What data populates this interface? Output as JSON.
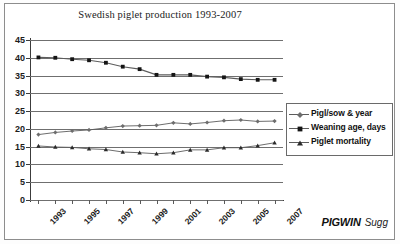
{
  "chart_data": {
    "type": "line",
    "title": "Swedish piglet production 1993-2007",
    "xlabel": "",
    "ylabel": "",
    "ylim": [
      0,
      45
    ],
    "ytick_step": 5,
    "yticks": [
      45,
      40,
      35,
      30,
      25,
      20,
      15,
      10,
      5,
      0
    ],
    "grid": true,
    "legend_position": "right",
    "x": [
      1993,
      1994,
      1995,
      1996,
      1997,
      1998,
      1999,
      2000,
      2001,
      2002,
      2003,
      2004,
      2005,
      2006,
      2007
    ],
    "xtick_labels": [
      "1993",
      "1995",
      "1997",
      "1999",
      "2001",
      "2003",
      "2005",
      "2007"
    ],
    "xtick_values": [
      1993,
      1995,
      1997,
      1999,
      2001,
      2003,
      2005,
      2007
    ],
    "series": [
      {
        "name": "Pigl/sow & year",
        "marker": "diamond",
        "values": [
          18.4,
          19.0,
          19.4,
          19.7,
          20.3,
          20.8,
          20.9,
          21.0,
          21.7,
          21.4,
          21.8,
          22.3,
          22.5,
          22.1,
          22.2
        ]
      },
      {
        "name": "Weaning age, days",
        "marker": "square",
        "values": [
          40.1,
          40.0,
          39.6,
          39.3,
          38.6,
          37.5,
          36.8,
          35.2,
          35.2,
          35.2,
          34.7,
          34.5,
          34.0,
          33.8,
          33.8
        ]
      },
      {
        "name": "Piglet mortality",
        "marker": "triangle",
        "values": [
          15.2,
          14.9,
          14.8,
          14.4,
          14.2,
          13.5,
          13.3,
          13.0,
          13.3,
          14.1,
          14.1,
          14.7,
          14.7,
          15.3,
          16.1
        ]
      }
    ]
  },
  "legend": {
    "entries": [
      {
        "label": "Pigl/sow & year"
      },
      {
        "label": "Weaning age, days"
      },
      {
        "label": "Piglet mortality"
      }
    ]
  },
  "brand": {
    "primary": "PIGWIN",
    "secondary": "Sugg"
  },
  "colors": {
    "series_line": "#5c5c5c",
    "marker": "#1a1a1a",
    "gridline": "#6f6f6f",
    "axis": "#3c3c3c",
    "text": "#101010",
    "background": "#ffffff",
    "border": "#8d8d8d"
  }
}
